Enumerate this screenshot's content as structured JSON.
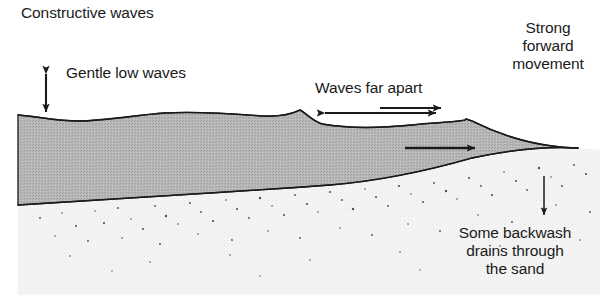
{
  "figure": {
    "title": "Constructive waves",
    "width": 606,
    "height": 302,
    "background_color": "#ffffff",
    "ink_color": "#1a1a1a"
  },
  "labels": {
    "title": "Constructive waves",
    "gentle_low_waves": "Gentle low waves",
    "waves_far_apart": "Waves far apart",
    "strong_forward_movement": "Strong\nforward\nmovement",
    "some_backwash": "Some backwash\ndrains through\nthe sand"
  },
  "regions": {
    "water": {
      "name": "sea-water-body",
      "fill_color": "#b5b5b5",
      "stroke_color": "#1a1a1a"
    },
    "sand": {
      "name": "sand-beach",
      "fill_color": "#f2f2f2",
      "speckle_color": "#555555"
    }
  },
  "arrows": {
    "wave_height": {
      "name": "wave-height-arrow",
      "kind": "double-vertical",
      "x": 46,
      "y_top": 68,
      "y_bottom": 118
    },
    "wavelength": {
      "name": "wavelength-arrow",
      "kind": "double-horizontal",
      "y": 113,
      "x_left": 318,
      "x_right": 443
    },
    "swash_outer": {
      "name": "swash-forward-arrow-outer",
      "kind": "single-right",
      "y": 108,
      "x_start": 380,
      "x_end": 447
    },
    "swash_inner": {
      "name": "swash-forward-arrow-inner",
      "kind": "single-right",
      "y": 148,
      "x_start": 405,
      "x_end": 481
    },
    "backwash": {
      "name": "backwash-down-arrow",
      "kind": "single-down",
      "x": 544,
      "y_start": 176,
      "y_end": 221
    }
  }
}
